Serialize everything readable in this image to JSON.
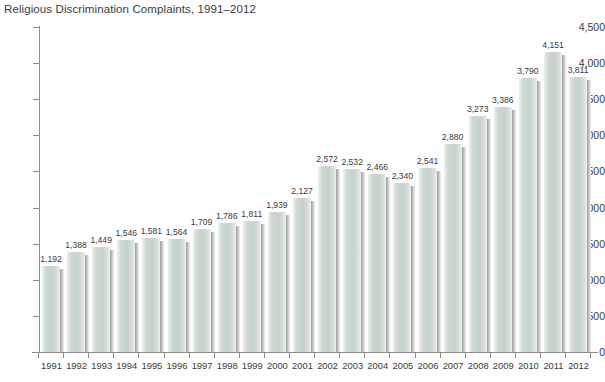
{
  "chart_data": {
    "type": "bar",
    "title": "Religious Discrimination Complaints, 1991–2012",
    "xlabel": "",
    "ylabel": "",
    "ylim": [
      0,
      4500
    ],
    "y_ticks": [
      "0",
      "500",
      "1,000",
      "1,500",
      "2,000",
      "2,500",
      "3,000",
      "3,500",
      "4,000",
      "4,500"
    ],
    "y_tick_values": [
      0,
      500,
      1000,
      1500,
      2000,
      2500,
      3000,
      3500,
      4000,
      4500
    ],
    "grid": false,
    "legend": null,
    "categories": [
      "1991",
      "1992",
      "1993",
      "1994",
      "1995",
      "1996",
      "1997",
      "1998",
      "1999",
      "2000",
      "2001",
      "2002",
      "2003",
      "2004",
      "2005",
      "2006",
      "2007",
      "2008",
      "2009",
      "2010",
      "2011",
      "2012"
    ],
    "values": [
      1192,
      1388,
      1449,
      1546,
      1581,
      1564,
      1709,
      1786,
      1811,
      1939,
      2127,
      2572,
      2532,
      2466,
      2340,
      2541,
      2880,
      3273,
      3386,
      3790,
      4151,
      3811
    ],
    "data_labels": [
      "1,192",
      "1,388",
      "1,449",
      "1,546",
      "1,581",
      "1,564",
      "1,709",
      "1,786",
      "1,811",
      "1,939",
      "2,127",
      "2,572",
      "2,532",
      "2,466",
      "2,340",
      "2,541",
      "2,880",
      "3,273",
      "3,386",
      "3,790",
      "4,151",
      "3,811"
    ],
    "colors": {
      "bar_fill": "#c6d2cb",
      "bar_highlight": "#e7ece8",
      "bar_shadow": "#8a8f8d",
      "axis": "#8d8d8d",
      "text": "#3b3b3b",
      "background": "#fefefe"
    }
  }
}
